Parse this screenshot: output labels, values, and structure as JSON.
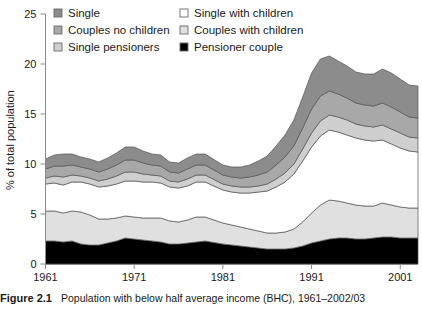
{
  "figure": {
    "caption_label": "Figure 2.1",
    "caption_text": "Population with below half average income (BHC), 1961–2002/03"
  },
  "axes": {
    "ylabel": "% of total population",
    "yticks": [
      "0",
      "5",
      "10",
      "15",
      "20",
      "25"
    ],
    "xticks": [
      "1961",
      "1971",
      "1981",
      "1991",
      "2001"
    ]
  },
  "legend": {
    "items": [
      {
        "label": "Single",
        "color": "#8c8c8c",
        "column": "left"
      },
      {
        "label": "Couples no children",
        "color": "#a8a8a8",
        "column": "left"
      },
      {
        "label": "Single pensioners",
        "color": "#cfcfcf",
        "column": "left"
      },
      {
        "label": "Single with children",
        "color": "#ffffff",
        "column": "right"
      },
      {
        "label": "Couples with children",
        "color": "#e0e0e0",
        "column": "right"
      },
      {
        "label": "Pensioner couple",
        "color": "#000000",
        "column": "right"
      }
    ]
  },
  "chart_data": {
    "type": "area",
    "stacked": true,
    "title": "Population with below half average income (BHC), 1961–2002/03",
    "xlabel": "",
    "ylabel": "% of total population",
    "ylim": [
      0,
      25
    ],
    "xlim": [
      1961,
      2003
    ],
    "grid": false,
    "legend_position": "top",
    "x": [
      1961,
      1962,
      1963,
      1964,
      1965,
      1966,
      1967,
      1968,
      1969,
      1970,
      1971,
      1972,
      1973,
      1974,
      1975,
      1976,
      1977,
      1978,
      1979,
      1981,
      1982,
      1983,
      1984,
      1985,
      1986,
      1987,
      1988,
      1989,
      1990,
      1991,
      1992,
      1993,
      1994,
      1995,
      1996,
      1997,
      1998,
      1999,
      2000,
      2001,
      2002,
      2003
    ],
    "series": [
      {
        "name": "Pensioner couple",
        "color": "#000000",
        "values": [
          2.3,
          2.3,
          2.2,
          2.3,
          2.0,
          1.9,
          1.9,
          2.1,
          2.3,
          2.6,
          2.5,
          2.4,
          2.3,
          2.2,
          2.0,
          2.0,
          2.1,
          2.2,
          2.3,
          2.0,
          1.9,
          1.8,
          1.7,
          1.6,
          1.5,
          1.5,
          1.5,
          1.6,
          1.8,
          2.1,
          2.3,
          2.5,
          2.6,
          2.6,
          2.5,
          2.5,
          2.6,
          2.7,
          2.7,
          2.6,
          2.6,
          2.6
        ]
      },
      {
        "name": "Couples with children",
        "color": "#e0e0e0",
        "values": [
          3.0,
          3.0,
          2.9,
          3.0,
          3.2,
          3.0,
          2.6,
          2.4,
          2.3,
          2.2,
          2.2,
          2.2,
          2.3,
          2.4,
          2.3,
          2.2,
          2.3,
          2.5,
          2.4,
          2.1,
          2.0,
          1.9,
          1.8,
          1.7,
          1.6,
          1.6,
          1.7,
          1.9,
          2.4,
          3.0,
          3.6,
          3.9,
          3.7,
          3.5,
          3.4,
          3.3,
          3.2,
          3.4,
          3.2,
          3.1,
          3.0,
          3.0
        ]
      },
      {
        "name": "Single with children",
        "color": "#ffffff",
        "values": [
          2.7,
          2.8,
          2.8,
          2.9,
          3.0,
          3.1,
          3.2,
          3.3,
          3.4,
          3.5,
          3.6,
          3.6,
          3.6,
          3.5,
          3.4,
          3.4,
          3.4,
          3.5,
          3.5,
          3.3,
          3.3,
          3.4,
          3.6,
          3.9,
          4.2,
          4.6,
          5.0,
          5.5,
          6.1,
          6.6,
          6.9,
          7.0,
          6.9,
          6.8,
          6.7,
          6.6,
          6.5,
          6.3,
          6.1,
          5.9,
          5.7,
          5.6
        ]
      },
      {
        "name": "Single pensioners",
        "color": "#cfcfcf",
        "values": [
          0.6,
          0.7,
          0.8,
          0.7,
          0.6,
          0.6,
          0.6,
          0.7,
          0.8,
          0.9,
          0.9,
          0.8,
          0.7,
          0.7,
          0.6,
          0.6,
          0.7,
          0.7,
          0.7,
          0.6,
          0.6,
          0.6,
          0.6,
          0.6,
          0.7,
          0.8,
          0.9,
          1.0,
          1.2,
          1.4,
          1.5,
          1.5,
          1.5,
          1.5,
          1.4,
          1.4,
          1.4,
          1.5,
          1.5,
          1.5,
          1.4,
          1.4
        ]
      },
      {
        "name": "Couples no children",
        "color": "#a8a8a8",
        "values": [
          0.9,
          1.0,
          1.1,
          1.0,
          0.9,
          0.9,
          0.9,
          1.0,
          1.1,
          1.2,
          1.2,
          1.1,
          1.0,
          1.0,
          0.9,
          0.9,
          1.0,
          1.0,
          1.0,
          0.9,
          0.9,
          0.9,
          1.0,
          1.1,
          1.2,
          1.4,
          1.6,
          1.8,
          2.1,
          2.4,
          2.5,
          2.4,
          2.3,
          2.2,
          2.1,
          2.1,
          2.1,
          2.2,
          2.2,
          2.1,
          2.0,
          2.0
        ]
      },
      {
        "name": "Single",
        "color": "#8c8c8c",
        "values": [
          1.0,
          1.1,
          1.2,
          1.1,
          1.0,
          1.0,
          1.0,
          1.1,
          1.2,
          1.3,
          1.3,
          1.2,
          1.1,
          1.1,
          1.0,
          1.0,
          1.1,
          1.1,
          1.1,
          1.0,
          1.0,
          1.1,
          1.2,
          1.4,
          1.6,
          1.9,
          2.2,
          2.6,
          3.1,
          3.6,
          3.7,
          3.5,
          3.3,
          3.2,
          3.1,
          3.1,
          3.2,
          3.4,
          3.4,
          3.3,
          3.2,
          3.2
        ]
      }
    ]
  }
}
